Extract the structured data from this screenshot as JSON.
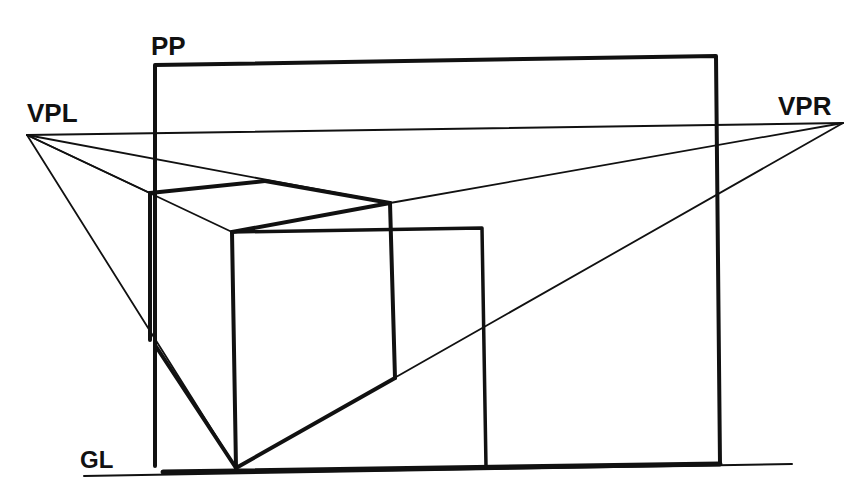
{
  "labels": {
    "picture_plane": "PP",
    "vanishing_point_left": "VPL",
    "vanishing_point_right": "VPR",
    "ground_line": "GL"
  },
  "colors": {
    "ink": "#111111",
    "paper": "#ffffff"
  }
}
